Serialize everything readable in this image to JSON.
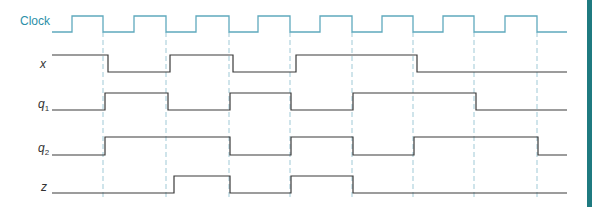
{
  "diagram": {
    "type": "timing-diagram",
    "colors": {
      "clock": "#5fa9bd",
      "signal": "#3a3a3a",
      "dashed": "#9fc9d6",
      "clock_label": "#2c8fa8",
      "side_bar": "#1f7a80"
    },
    "x_start": 52,
    "x_end": 567,
    "falling_edges": [
      103,
      166,
      229,
      290,
      352,
      413,
      474,
      537
    ],
    "dashed_top": 32,
    "dashed_bottom": 200,
    "signals": [
      {
        "name": "Clock",
        "label": "Clock",
        "high_y": 16,
        "low_y": 32,
        "initial": 0,
        "transitions": [
          72,
          103,
          134,
          166,
          196,
          229,
          258,
          290,
          320,
          352,
          382,
          413,
          443,
          474,
          505,
          537
        ]
      },
      {
        "name": "x",
        "label": "x",
        "subscript": "",
        "high_y": 55,
        "low_y": 72,
        "initial": 1,
        "transitions": [
          108,
          170,
          233,
          296,
          417
        ]
      },
      {
        "name": "q1",
        "label": "q",
        "subscript": "1",
        "high_y": 93,
        "low_y": 110,
        "initial": 0,
        "transitions": [
          105,
          168,
          230,
          291,
          353,
          476
        ]
      },
      {
        "name": "q2",
        "label": "q",
        "subscript": "2",
        "high_y": 137,
        "low_y": 155,
        "initial": 0,
        "transitions": [
          105,
          230,
          291,
          353,
          414,
          538
        ]
      },
      {
        "name": "z",
        "label": "z",
        "subscript": "",
        "high_y": 176,
        "low_y": 193,
        "initial": 0,
        "transitions": [
          174,
          230,
          291,
          353
        ]
      }
    ]
  },
  "labels": {
    "clock": "Clock",
    "x": "x",
    "q1": "q",
    "q1_sub": "1",
    "q2": "q",
    "q2_sub": "2",
    "z": "z"
  }
}
